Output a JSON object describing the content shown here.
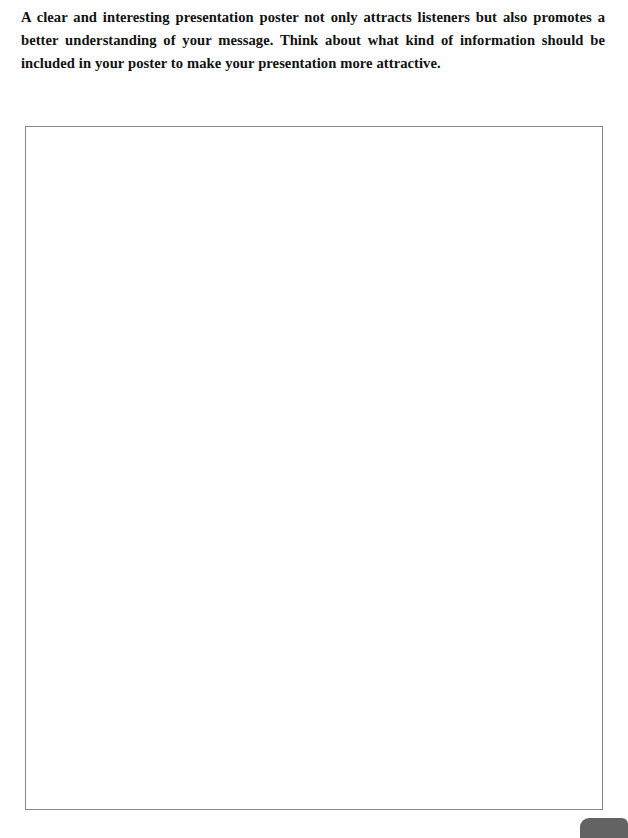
{
  "page": {
    "background_color": "#fefefe",
    "width": 622,
    "height": 831
  },
  "instruction": {
    "text": "A clear and interesting presentation poster not only attracts listeners but also promotes a better understanding of your message. Think about what kind of information should be included in your poster to make your presentation more attractive.",
    "alignment": "justify",
    "weight": "bold",
    "color": "#121212"
  },
  "answer_box": {
    "content": "",
    "placeholder": "",
    "border_color": "#85858a",
    "fill_color": "#ffffff"
  },
  "corner_tab": {
    "label": "",
    "color": "#636363"
  }
}
